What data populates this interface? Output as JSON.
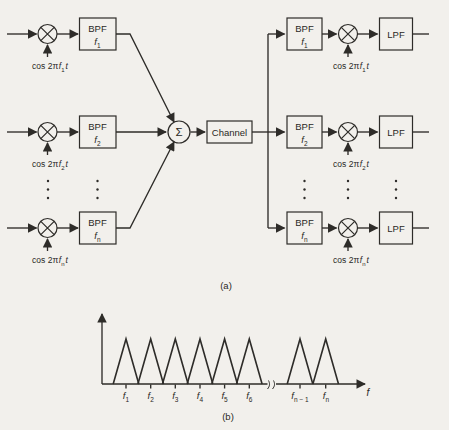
{
  "colors": {
    "ink": "#2e2c29",
    "paper": "#f2f0ec"
  },
  "captions": {
    "a": "(a)",
    "b": "(b)"
  },
  "mux": {
    "summer": "Σ",
    "channel": "Channel",
    "tx": [
      {
        "filter": "BPF",
        "f": "f",
        "sub": "1",
        "car_pre": "cos 2π",
        "car_f": "f",
        "car_sub": "1",
        "car_t": "t"
      },
      {
        "filter": "BPF",
        "f": "f",
        "sub": "2",
        "car_pre": "cos 2π",
        "car_f": "f",
        "car_sub": "2",
        "car_t": "t"
      },
      {
        "filter": "BPF",
        "f": "f",
        "sub": "n",
        "car_pre": "cos 2π",
        "car_f": "f",
        "car_sub": "n",
        "car_t": "t"
      }
    ],
    "rx": [
      {
        "filter": "BPF",
        "f": "f",
        "sub": "1",
        "lpf": "LPF",
        "car_pre": "cos 2π",
        "car_f": "f",
        "car_sub": "1",
        "car_t": "t"
      },
      {
        "filter": "BPF",
        "f": "f",
        "sub": "2",
        "lpf": "LPF",
        "car_pre": "cos 2π",
        "car_f": "f",
        "car_sub": "2",
        "car_t": "t"
      },
      {
        "filter": "BPF",
        "f": "f",
        "sub": "n",
        "lpf": "LPF",
        "car_pre": "cos 2π",
        "car_f": "f",
        "car_sub": "n",
        "car_t": "t"
      }
    ]
  },
  "spectrum": {
    "axis_label": "f",
    "peak_labels": [
      {
        "f": "f",
        "sub": "1"
      },
      {
        "f": "f",
        "sub": "2"
      },
      {
        "f": "f",
        "sub": "3"
      },
      {
        "f": "f",
        "sub": "4"
      },
      {
        "f": "f",
        "sub": "5"
      },
      {
        "f": "f",
        "sub": "6"
      },
      {
        "f": "f",
        "sub": "n − 1"
      },
      {
        "f": "f",
        "sub": "n"
      }
    ]
  }
}
